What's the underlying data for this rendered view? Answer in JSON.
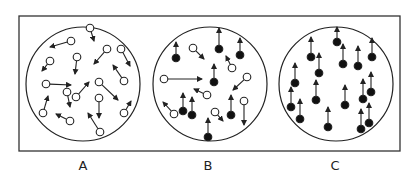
{
  "figure": {
    "frame": {
      "x": 19,
      "y": 16,
      "width": 381,
      "height": 135,
      "stroke": "#333333"
    },
    "colors": {
      "stroke": "#222222",
      "open_fill": "#ffffff",
      "filled_fill": "#111111",
      "background": "#ffffff"
    }
  },
  "panels": [
    {
      "label": "A",
      "label_x": 83,
      "circle": {
        "cx": 83,
        "cy": 84,
        "r": 57
      },
      "molecules": [
        {
          "x": 90,
          "y": 28,
          "tx": 94,
          "ty": 41,
          "filled": false
        },
        {
          "x": 71,
          "y": 41,
          "tx": 50,
          "ty": 47,
          "filled": false
        },
        {
          "x": 107,
          "y": 49,
          "tx": 94,
          "ty": 64,
          "filled": false
        },
        {
          "x": 121,
          "y": 49,
          "tx": 130,
          "ty": 66,
          "filled": false
        },
        {
          "x": 50,
          "y": 61,
          "tx": 42,
          "ty": 71,
          "filled": false
        },
        {
          "x": 77,
          "y": 57,
          "tx": 75,
          "ty": 74,
          "filled": false
        },
        {
          "x": 46,
          "y": 84,
          "tx": 71,
          "ty": 85,
          "filled": false
        },
        {
          "x": 124,
          "y": 81,
          "tx": 113,
          "ty": 65,
          "filled": false
        },
        {
          "x": 99,
          "y": 82,
          "tx": 118,
          "ty": 100,
          "filled": false
        },
        {
          "x": 67,
          "y": 92,
          "tx": 70,
          "ty": 107,
          "filled": false
        },
        {
          "x": 76,
          "y": 97,
          "tx": 89,
          "ty": 82,
          "filled": false
        },
        {
          "x": 99,
          "y": 98,
          "tx": 99,
          "ty": 118,
          "filled": false
        },
        {
          "x": 43,
          "y": 113,
          "tx": 48,
          "ty": 96,
          "filled": false
        },
        {
          "x": 70,
          "y": 121,
          "tx": 56,
          "ty": 114,
          "filled": false
        },
        {
          "x": 124,
          "y": 113,
          "tx": 131,
          "ty": 101,
          "filled": false
        },
        {
          "x": 100,
          "y": 132,
          "tx": 88,
          "ty": 113,
          "filled": false
        }
      ]
    },
    {
      "label": "B",
      "label_x": 208,
      "circle": {
        "cx": 210,
        "cy": 84,
        "r": 57
      },
      "molecules": [
        {
          "x": 176,
          "y": 58,
          "tx": 176,
          "ty": 42,
          "filled": true
        },
        {
          "x": 193,
          "y": 48,
          "tx": 204,
          "ty": 59,
          "filled": false
        },
        {
          "x": 219,
          "y": 49,
          "tx": 219,
          "ty": 28,
          "filled": true
        },
        {
          "x": 240,
          "y": 55,
          "tx": 240,
          "ty": 38,
          "filled": true
        },
        {
          "x": 232,
          "y": 68,
          "tx": 226,
          "ty": 56,
          "filled": false
        },
        {
          "x": 214,
          "y": 82,
          "tx": 214,
          "ty": 64,
          "filled": true
        },
        {
          "x": 164,
          "y": 79,
          "tx": 202,
          "ty": 79,
          "filled": false
        },
        {
          "x": 247,
          "y": 77,
          "tx": 233,
          "ty": 90,
          "filled": false
        },
        {
          "x": 207,
          "y": 95,
          "tx": 194,
          "ty": 89,
          "filled": false
        },
        {
          "x": 183,
          "y": 111,
          "tx": 183,
          "ty": 93,
          "filled": true
        },
        {
          "x": 192,
          "y": 115,
          "tx": 192,
          "ty": 97,
          "filled": true
        },
        {
          "x": 174,
          "y": 114,
          "tx": 163,
          "ty": 102,
          "filled": false
        },
        {
          "x": 215,
          "y": 112,
          "tx": 223,
          "ty": 121,
          "filled": false
        },
        {
          "x": 231,
          "y": 115,
          "tx": 231,
          "ty": 95,
          "filled": true
        },
        {
          "x": 244,
          "y": 101,
          "tx": 244,
          "ty": 125,
          "filled": false
        },
        {
          "x": 208,
          "y": 137,
          "tx": 208,
          "ty": 118,
          "filled": true
        }
      ]
    },
    {
      "label": "C",
      "label_x": 335,
      "circle": {
        "cx": 336,
        "cy": 84,
        "r": 57
      },
      "molecules": [
        {
          "x": 337,
          "y": 42,
          "tx": 337,
          "ty": 27,
          "filled": true
        },
        {
          "x": 311,
          "y": 57,
          "tx": 311,
          "ty": 37,
          "filled": true
        },
        {
          "x": 343,
          "y": 64,
          "tx": 343,
          "ty": 44,
          "filled": true
        },
        {
          "x": 358,
          "y": 66,
          "tx": 358,
          "ty": 46,
          "filled": true
        },
        {
          "x": 372,
          "y": 57,
          "tx": 372,
          "ty": 38,
          "filled": true
        },
        {
          "x": 319,
          "y": 73,
          "tx": 319,
          "ty": 53,
          "filled": true
        },
        {
          "x": 295,
          "y": 83,
          "tx": 295,
          "ty": 63,
          "filled": true
        },
        {
          "x": 316,
          "y": 100,
          "tx": 316,
          "ty": 80,
          "filled": true
        },
        {
          "x": 291,
          "y": 107,
          "tx": 291,
          "ty": 87,
          "filled": true
        },
        {
          "x": 300,
          "y": 119,
          "tx": 300,
          "ty": 99,
          "filled": true
        },
        {
          "x": 345,
          "y": 105,
          "tx": 345,
          "ty": 85,
          "filled": true
        },
        {
          "x": 363,
          "y": 99,
          "tx": 363,
          "ty": 79,
          "filled": true
        },
        {
          "x": 371,
          "y": 92,
          "tx": 371,
          "ty": 72,
          "filled": true
        },
        {
          "x": 328,
          "y": 127,
          "tx": 328,
          "ty": 107,
          "filled": true
        },
        {
          "x": 361,
          "y": 129,
          "tx": 361,
          "ty": 109,
          "filled": true
        },
        {
          "x": 369,
          "y": 123,
          "tx": 369,
          "ty": 103,
          "filled": true
        }
      ]
    }
  ]
}
